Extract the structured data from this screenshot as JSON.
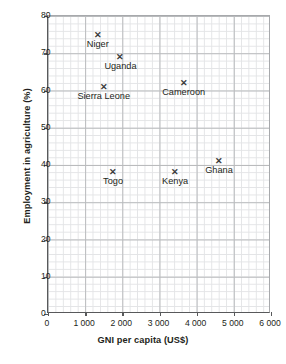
{
  "chart_data": {
    "type": "scatter",
    "title": "",
    "xlabel": "GNI per capita (US$)",
    "ylabel": "Employment in agriculture (%)",
    "xlim": [
      0,
      6000
    ],
    "ylim": [
      0,
      80
    ],
    "xticks": [
      0,
      1000,
      2000,
      3000,
      4000,
      5000,
      6000
    ],
    "xtick_labels": [
      "0",
      "1 000",
      "2 000",
      "3 000",
      "4 000",
      "5 000",
      "6 000"
    ],
    "yticks": [
      0,
      10,
      20,
      30,
      40,
      50,
      60,
      70,
      80
    ],
    "ytick_labels": [
      "0",
      "10",
      "20",
      "30",
      "40",
      "50",
      "60",
      "70",
      "80"
    ],
    "grid": true,
    "grid_minor": true,
    "legend": "none",
    "marker": "x",
    "marker_glyph": "✕",
    "points": [
      {
        "label": "Niger",
        "x": 1340,
        "y": 75,
        "label_pos": "below"
      },
      {
        "label": "Uganda",
        "x": 1950,
        "y": 69,
        "label_pos": "below"
      },
      {
        "label": "Sierra Leone",
        "x": 1500,
        "y": 61,
        "label_pos": "below"
      },
      {
        "label": "Cameroon",
        "x": 3650,
        "y": 62,
        "label_pos": "below"
      },
      {
        "label": "Togo",
        "x": 1750,
        "y": 38,
        "label_pos": "below"
      },
      {
        "label": "Kenya",
        "x": 3420,
        "y": 38,
        "label_pos": "below"
      },
      {
        "label": "Ghana",
        "x": 4600,
        "y": 41,
        "label_pos": "below"
      }
    ],
    "colors": {
      "marker": "#3b3b3d",
      "text": "#231f20",
      "axis": "#58595b",
      "grid_major": "#b9bbbd",
      "grid_minor": "#e3e4e6",
      "background": "#ffffff"
    }
  }
}
